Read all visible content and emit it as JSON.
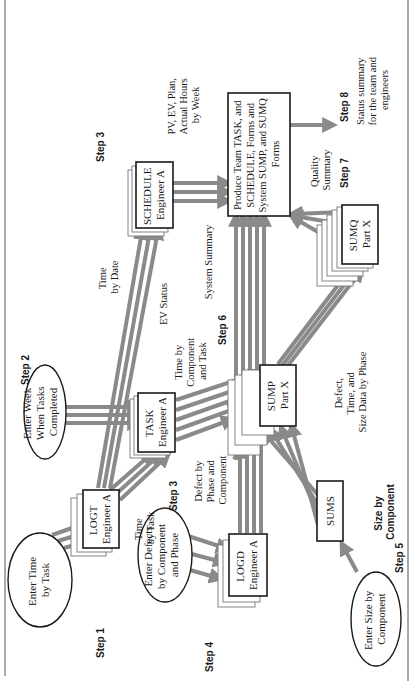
{
  "diagram": {
    "orientation": "rotated-90-ccw",
    "colors": {
      "arrow": "#8a8a8a",
      "box_stroke": "#1a1a1a",
      "background": "#ffffff"
    },
    "steps": {
      "step1": "Step 1",
      "step2": "Step 2",
      "step3a": "Step 3",
      "step3b": "Step 3",
      "step4": "Step 4",
      "step5": "Step 5",
      "step6": "Step 6",
      "step7": "Step 7",
      "step8": "Step 8"
    },
    "inputs": {
      "enter_time": [
        "Enter Time",
        "by Task"
      ],
      "enter_week": [
        "Enter Week",
        "When Tasks",
        "Completed"
      ],
      "enter_defects": [
        "Enter Defects",
        "by Component",
        "and Phase"
      ],
      "enter_size": [
        "Enter Size by",
        "Component"
      ]
    },
    "forms": {
      "logt": [
        "LOGT",
        "Engineer A"
      ],
      "task": [
        "TASK",
        "Engineer A"
      ],
      "schedule": [
        "SCHEDULE",
        "Engineer A"
      ],
      "logd": [
        "LOGD",
        "Engineer A"
      ],
      "sums": [
        "SUMS"
      ],
      "sump": [
        "SUMP",
        "Part X"
      ],
      "sumq": [
        "SUMQ",
        "Part X"
      ],
      "produce": [
        "Produce Team TASK, and",
        "SCHEDULE, Forms and",
        "System SUMP, and SUMQ",
        "Forms"
      ]
    },
    "labels": {
      "time_by_task": [
        "Time",
        "by Task"
      ],
      "time_by_date": [
        "Time",
        "by Date"
      ],
      "ev_status": [
        "EV Status"
      ],
      "time_by_component": [
        "Time by",
        "Component",
        "and Task"
      ],
      "defect_by_phase": [
        "Defect by",
        "Phase and",
        "Component"
      ],
      "system_summary": [
        "System Summary"
      ],
      "pv_ev": [
        "PV, EV, Plan,",
        "Actual Hours",
        "by Week"
      ],
      "quality_summary": [
        "Quality",
        "Summary"
      ],
      "status_summary": [
        "Status summary",
        "for the team and",
        "engineers"
      ],
      "size_by_component": [
        "Size by",
        "Component"
      ],
      "defect_time_size": [
        "Defect,",
        "Time, and",
        "Size Data by Phase"
      ]
    }
  }
}
